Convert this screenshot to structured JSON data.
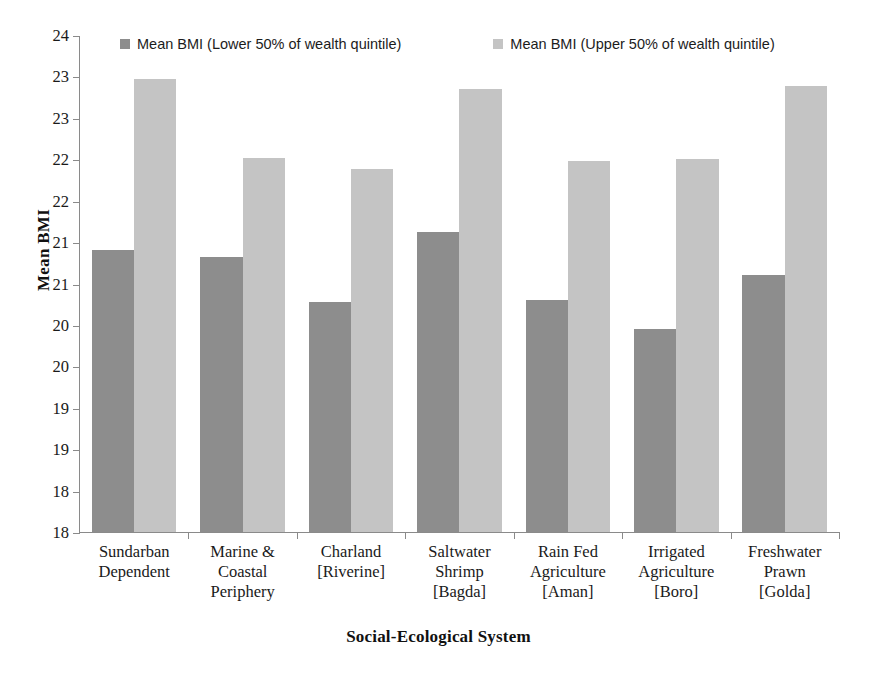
{
  "chart_data": {
    "type": "bar",
    "title": "",
    "subtitle": "",
    "xlabel": "Social-Ecological System",
    "ylabel": "Mean BMI",
    "ylim": [
      18,
      24
    ],
    "ytick_step": 0.5,
    "ytick_labels": [
      "24",
      "23",
      "23",
      "22",
      "22",
      "21",
      "21",
      "20",
      "20",
      "19",
      "19",
      "18"
    ],
    "ytick_values": [
      24,
      23.5,
      23,
      22.5,
      22,
      21.5,
      21,
      20.5,
      20,
      19.5,
      19,
      18.5,
      18
    ],
    "grid": false,
    "legend_position": "top",
    "categories": [
      "Sundarban\nDependent",
      "Marine &\nCoastal\nPeriphery",
      "Charland\n[Riverine]",
      "Saltwater\nShrimp\n[Bagda]",
      "Rain Fed\nAgriculture\n[Aman]",
      "Irrigated\nAgriculture\n[Boro]",
      "Freshwater\nPrawn\n[Golda]"
    ],
    "series": [
      {
        "name": "Mean BMI (Lower 50% of wealth quintile)",
        "color": "#8d8d8d",
        "values": [
          21.4,
          21.32,
          20.78,
          21.62,
          20.8,
          20.45,
          21.1
        ]
      },
      {
        "name": "Mean BMI (Upper 50% of wealth quintile)",
        "color": "#c4c4c4",
        "values": [
          23.47,
          22.52,
          22.38,
          23.35,
          22.48,
          22.5,
          23.38
        ]
      }
    ]
  },
  "legend": {
    "entries": [
      {
        "label": "Mean BMI (Lower 50% of wealth quintile)",
        "swatch": "legend-swatch-lower"
      },
      {
        "label": "Mean BMI (Upper 50% of wealth quintile)",
        "swatch": "legend-swatch-upper"
      }
    ]
  },
  "axes": {
    "y_title": "Mean BMI",
    "x_title": "Social-Ecological System"
  }
}
